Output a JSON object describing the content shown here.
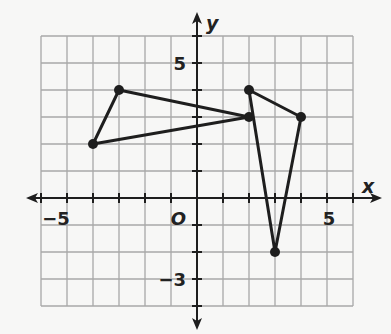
{
  "graph": {
    "axis_labels": {
      "x": "x",
      "y": "y",
      "origin": "O"
    },
    "tick_labels": [
      {
        "text": "−5",
        "axis": "x",
        "value": -5
      },
      {
        "text": "5",
        "axis": "x",
        "value": 5
      },
      {
        "text": "5",
        "axis": "y",
        "value": 5
      },
      {
        "text": "−3",
        "axis": "y",
        "value": -3
      }
    ],
    "grid": {
      "xmin": -6,
      "xmax": 6,
      "ymin": -4,
      "ymax": 6
    },
    "colors": {
      "grid": "#a8a8a8",
      "axis": "#1e1e1e",
      "figure": "#1e1e1e",
      "background": "#f7f7f6"
    },
    "figures": [
      {
        "name": "triangle-left",
        "vertices": [
          [
            -3,
            4
          ],
          [
            -4,
            2
          ],
          [
            2,
            3
          ]
        ]
      },
      {
        "name": "triangle-right",
        "vertices": [
          [
            2,
            4
          ],
          [
            4,
            3
          ],
          [
            3,
            -2
          ]
        ]
      }
    ]
  }
}
